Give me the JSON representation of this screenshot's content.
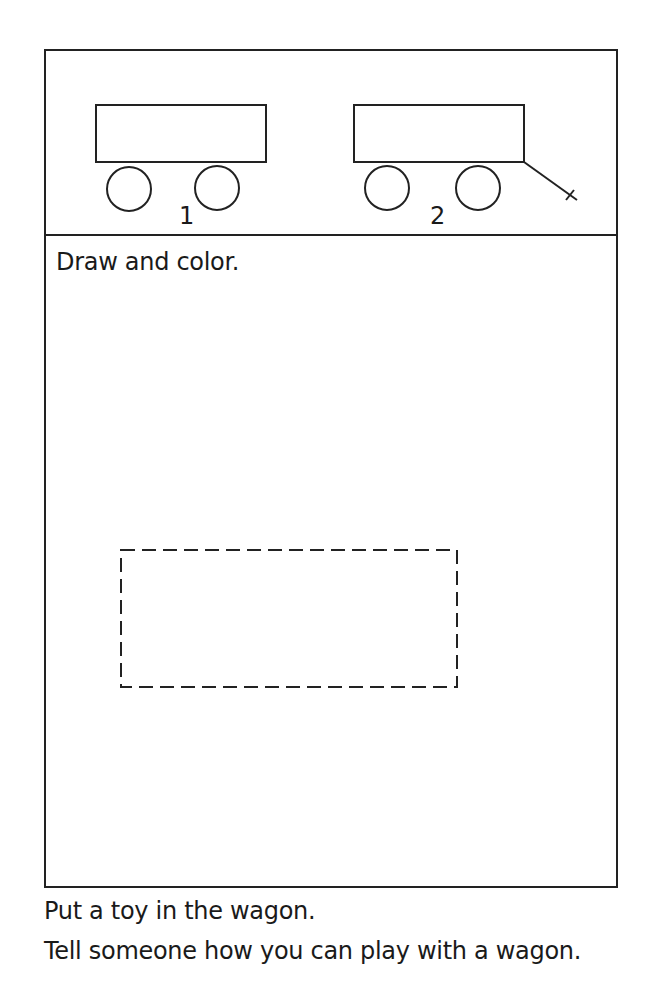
{
  "worksheet": {
    "wagons": [
      {
        "label": "1",
        "has_handle": false
      },
      {
        "label": "2",
        "has_handle": true
      }
    ],
    "instruction": "Draw and color.",
    "footer": [
      "Put a toy in the wagon.",
      "Tell someone how you can play with a wagon."
    ],
    "colors": {
      "ink": "#1a1a1a",
      "paper": "#ffffff"
    }
  }
}
